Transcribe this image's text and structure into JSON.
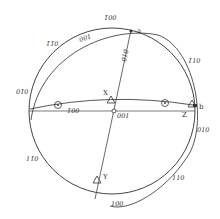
{
  "diagram": {
    "type": "stereographic-projection",
    "colors": {
      "line": "#444444",
      "text": "#333333",
      "background": "#ffffff"
    },
    "primitive_circle": {
      "cx": 112,
      "cy": 111,
      "r": 83
    },
    "zone_labels": {
      "top_outer": "1̄00",
      "top_left_outer": "1̄1̄0",
      "top_inner": "001",
      "top_right_outer": "1̄10",
      "left": "01̄0",
      "equator": "1̄00",
      "vertical_zone": "010",
      "center": "001",
      "right": "010",
      "bottom_left": "11̄0",
      "bottom_right": "110",
      "bottom": "100"
    },
    "points": {
      "a": "a",
      "b": "b",
      "X": "X",
      "Y": "Y",
      "Z": "Z"
    }
  }
}
